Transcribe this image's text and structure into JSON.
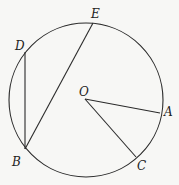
{
  "diagram": {
    "circle": {
      "cx": 86,
      "cy": 100,
      "r": 77,
      "center_label": "O"
    },
    "points": {
      "E": {
        "x": 93,
        "y": 23,
        "label": "E",
        "lx": 91,
        "ly": 18
      },
      "D": {
        "x": 25,
        "y": 52,
        "label": "D",
        "lx": 15,
        "ly": 50
      },
      "B": {
        "x": 25,
        "y": 149,
        "label": "B",
        "lx": 12,
        "ly": 166
      },
      "O": {
        "x": 85,
        "y": 99,
        "label": "O",
        "lx": 79,
        "ly": 96
      },
      "A": {
        "x": 160,
        "y": 113,
        "label": "A",
        "lx": 164,
        "ly": 116
      },
      "C": {
        "x": 136,
        "y": 157,
        "label": "C",
        "lx": 137,
        "ly": 170
      }
    },
    "segments": [
      {
        "name": "chord-BD",
        "from": "B",
        "to": "D"
      },
      {
        "name": "chord-BE",
        "from": "B",
        "to": "E"
      },
      {
        "name": "radius-OA",
        "from": "O",
        "to": "A"
      },
      {
        "name": "radius-OC",
        "from": "O",
        "to": "C"
      }
    ],
    "colors": {
      "stroke": "#2a2a2a",
      "background": "#f7f7f5",
      "text": "#222222"
    }
  }
}
